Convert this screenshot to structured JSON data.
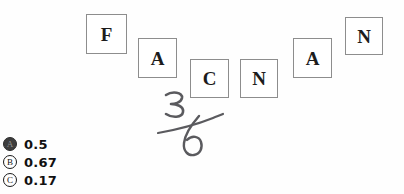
{
  "canvas": {
    "width": 404,
    "height": 194,
    "background_color": "#fefefe"
  },
  "tiles": {
    "border_color": "#8d8d8d",
    "fill_color": "#ffffff",
    "text_color": "#1c1c1c",
    "items": [
      {
        "label": "F",
        "x": 86,
        "y": 14,
        "w": 41,
        "h": 40,
        "font_size": 19
      },
      {
        "label": "A",
        "x": 138,
        "y": 38,
        "w": 39,
        "h": 40,
        "font_size": 19
      },
      {
        "label": "C",
        "x": 190,
        "y": 59,
        "w": 39,
        "h": 39,
        "font_size": 19
      },
      {
        "label": "N",
        "x": 240,
        "y": 59,
        "w": 38,
        "h": 39,
        "font_size": 19
      },
      {
        "label": "A",
        "x": 293,
        "y": 38,
        "w": 39,
        "h": 40,
        "font_size": 19
      },
      {
        "label": "N",
        "x": 345,
        "y": 17,
        "w": 38,
        "h": 38,
        "font_size": 19
      }
    ]
  },
  "annotation": {
    "kind": "handwritten-fraction",
    "numerator": "3",
    "denominator": "6",
    "reads_as": "3/6",
    "ink_color": "#5a5a5e",
    "strokes": {
      "numerator_path": "M 166 95 C 172 91, 183 92, 182 98 C 181 103, 174 104, 171 104 C 176 104, 184 106, 183 112 C 182 118, 172 118, 166 114",
      "fraction_bar_path": "M 158 133 C 175 130, 198 124, 213 118 C 218 116, 221 115, 223 114",
      "denominator_path": "M 199 116 C 192 124, 185 134, 184 143 C 183 151, 188 156, 194 155 C 200 154, 203 148, 201 142 C 199 136, 192 135, 187 140"
    }
  },
  "choices": {
    "selected_id": "A",
    "options": [
      {
        "id": "A",
        "label": "0.5",
        "selected": true
      },
      {
        "id": "B",
        "label": "0.67",
        "selected": false
      },
      {
        "id": "C",
        "label": "0.17",
        "selected": false
      }
    ]
  }
}
